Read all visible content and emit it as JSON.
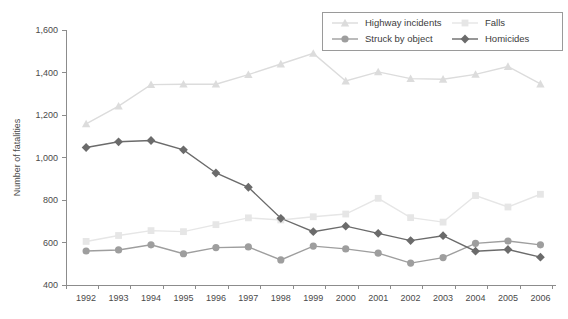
{
  "chart_data": {
    "type": "line",
    "title": "",
    "xlabel": "",
    "ylabel": "Number of fatalities",
    "categories": [
      "1992",
      "1993",
      "1994",
      "1995",
      "1996",
      "1997",
      "1998",
      "1999",
      "2000",
      "2001",
      "2002",
      "2003",
      "2004",
      "2005",
      "2006"
    ],
    "x": [
      1992,
      1993,
      1994,
      1995,
      1996,
      1997,
      1998,
      1999,
      2000,
      2001,
      2002,
      2003,
      2004,
      2005,
      2006
    ],
    "ylim": [
      400,
      1600
    ],
    "yticks": [
      400,
      600,
      800,
      1000,
      1200,
      1400,
      1600
    ],
    "ytick_labels": [
      "400",
      "600",
      "800",
      "1,000",
      "1,200",
      "1,400",
      "1,600"
    ],
    "grid": false,
    "legend_position": "top-right",
    "series": [
      {
        "name": "Highway incidents",
        "color": "#dcdcdc",
        "marker": "triangle",
        "values": [
          1158,
          1242,
          1343,
          1345,
          1345,
          1390,
          1440,
          1490,
          1360,
          1403,
          1371,
          1368,
          1391,
          1428,
          1346
        ]
      },
      {
        "name": "Falls",
        "color": "#e6e6e6",
        "marker": "square",
        "values": [
          605,
          633,
          656,
          651,
          684,
          716,
          706,
          721,
          734,
          808,
          717,
          696,
          821,
          767,
          827
        ]
      },
      {
        "name": "Struck by object",
        "color": "#9e9e9e",
        "marker": "circle",
        "values": [
          560,
          565,
          589,
          547,
          576,
          579,
          518,
          583,
          570,
          550,
          503,
          529,
          596,
          607,
          589
        ]
      },
      {
        "name": "Homicides",
        "color": "#6b6b6b",
        "marker": "diamond",
        "values": [
          1047,
          1074,
          1080,
          1036,
          927,
          860,
          714,
          651,
          677,
          643,
          609,
          632,
          559,
          567,
          531
        ]
      }
    ]
  },
  "legend": {
    "entries": [
      {
        "label": "Highway incidents"
      },
      {
        "label": "Falls"
      },
      {
        "label": "Struck by object"
      },
      {
        "label": "Homicides"
      }
    ]
  }
}
